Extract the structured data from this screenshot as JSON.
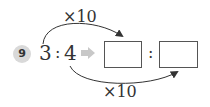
{
  "problem": {
    "number": "9",
    "ratio_left": "3",
    "ratio_colon": ":",
    "ratio_right": "4",
    "answer_colon": ":",
    "answer_box_1": "",
    "answer_box_2": "",
    "top_multiplier": "×10",
    "bottom_multiplier": "×10"
  },
  "colors": {
    "badge_bg": "#d9d9d9",
    "arrow_fill": "#c8c8c8",
    "curve": "#333333"
  }
}
